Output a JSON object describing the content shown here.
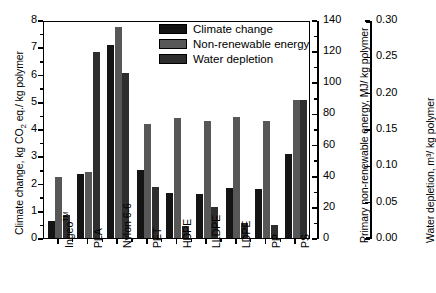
{
  "chart_data": {
    "type": "bar",
    "title": "",
    "subtitle": "",
    "grid": false,
    "legend_position": "top-center",
    "categories": [
      "Ingeo™",
      "PLA",
      "Nylon 6-6",
      "PET",
      "HDPE",
      "LLDPE",
      "LDPE",
      "PP",
      "PS"
    ],
    "series": [
      {
        "name": "Climate change",
        "color": "#141414",
        "axis": "left",
        "unit": "kg CO2 eq./ kg polymer",
        "values": [
          0.62,
          2.34,
          7.1,
          2.5,
          1.65,
          1.6,
          1.82,
          1.8,
          3.1
        ]
      },
      {
        "name": "Non-renewable energy",
        "color": "#575757",
        "axis": "right-1",
        "unit": "MJ/ kg polymer",
        "values": [
          39.0,
          42.5,
          135.5,
          73.5,
          77.0,
          75.0,
          78.0,
          75.0,
          88.5
        ]
      },
      {
        "name": "Water depletion",
        "color": "#2e2e2e",
        "axis": "right-2",
        "unit": "m3/ kg polymer",
        "values": [
          0.0315,
          0.256,
          0.227,
          0.0705,
          0.016,
          0.043,
          0.0205,
          0.0185,
          0.19
        ]
      }
    ],
    "axes": {
      "x": {
        "label": "",
        "ticks": [
          "Ingeo™",
          "PLA",
          "Nylon 6-6",
          "PET",
          "HDPE",
          "LLDPE",
          "LDPE",
          "PP",
          "PS"
        ]
      },
      "left": {
        "label": "Climate change, kg CO₂ eq./ kg polymer",
        "lim": [
          0,
          8
        ],
        "ticks": [
          "0",
          "1",
          "2",
          "3",
          "4",
          "5",
          "6",
          "7",
          "8"
        ],
        "tick_values": [
          0,
          1,
          2,
          3,
          4,
          5,
          6,
          7,
          8
        ]
      },
      "right_1": {
        "label": "Primary non-renewable energy, MJ/ kg polymer",
        "lim": [
          0,
          140
        ],
        "ticks": [
          "0",
          "20",
          "40",
          "60",
          "80",
          "100",
          "120",
          "140"
        ],
        "tick_values": [
          0,
          20,
          40,
          60,
          80,
          100,
          120,
          140
        ]
      },
      "right_2": {
        "label": "Water depletion, m³/ kg polymer",
        "lim": [
          0,
          0.3
        ],
        "ticks": [
          "0.00",
          "0.05",
          "0.10",
          "0.15",
          "0.20",
          "0.25",
          "0.30"
        ],
        "tick_values": [
          0,
          0.05,
          0.1,
          0.15,
          0.2,
          0.25,
          0.3
        ]
      }
    },
    "legend": [
      {
        "label": "Climate change",
        "color": "#141414"
      },
      {
        "label": "Non-renewable energy",
        "color": "#575757"
      },
      {
        "label": "Water depletion",
        "color": "#2e2e2e"
      }
    ]
  }
}
